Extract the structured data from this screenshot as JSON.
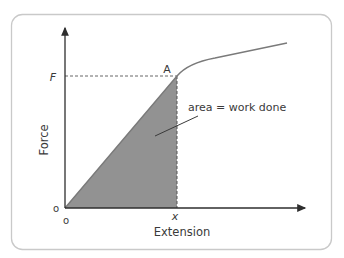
{
  "figure": {
    "type": "force-extension graph",
    "frame": {
      "border_color": "#c9c9c9",
      "corner_radius": 10
    },
    "axes": {
      "x_label": "Extension",
      "y_label": "Force",
      "origin_x_label": "o",
      "origin_y_label": "o",
      "x_tick_label": "x",
      "y_tick_label": "F",
      "axis_color": "#3a3a3a"
    },
    "point": {
      "label": "A"
    },
    "shaded_region": {
      "label": "area = work done",
      "fill_color": "#8c8c8c"
    },
    "curve": {
      "description": "straight line from origin to A, then curves and flattens",
      "color": "#7a7a7a"
    },
    "guide_lines": {
      "style": "dashed",
      "color": "#666666"
    }
  }
}
